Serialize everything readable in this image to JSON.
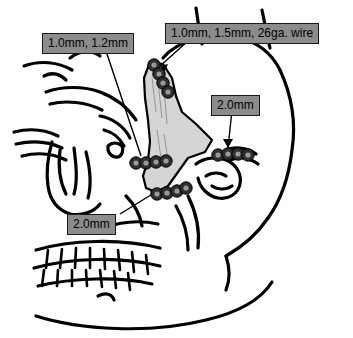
{
  "figure": {
    "kind": "anatomical-diagram",
    "background_color": "#ffffff",
    "line_color": "#000000",
    "shaded_bone_color": "#d5d5d5",
    "label_background_color": "#8c8c8c",
    "label_border_color": "#1a1a1a",
    "label_text_color": "#000000",
    "hardware_color": "#2b2b2b"
  },
  "callouts": [
    {
      "id": "frontozygomatic-lower",
      "text": "1.0mm, 1.2mm",
      "leader": "line from label down-right to infraorbital rim plate"
    },
    {
      "id": "frontozygomatic-upper",
      "text": "1.0mm, 1.5mm, 26ga. wire",
      "leader": "arrow from label down-left to frontozygomatic suture plate"
    },
    {
      "id": "zygomatic-arch",
      "text": "2.0mm",
      "leader": "arrow from label straight down to zygomatic arch plate"
    },
    {
      "id": "zygomaticomaxillary-buttress",
      "text": "2.0mm",
      "leader": "arrow from label up-right to buttress plate"
    }
  ],
  "hardware_sites": [
    {
      "id": "frontozygomatic-suture",
      "label_ref": "1.0mm, 1.5mm, 26ga. wire",
      "orientation": "vertical chain",
      "screw_count": 4
    },
    {
      "id": "infraorbital-rim",
      "label_ref": "1.0mm, 1.2mm",
      "orientation": "horizontal row",
      "screw_count": 5
    },
    {
      "id": "zygomatic-arch",
      "label_ref": "2.0mm",
      "orientation": "horizontal row",
      "screw_count": 4
    },
    {
      "id": "zygomaticomaxillary-buttress",
      "label_ref": "2.0mm",
      "orientation": "diagonal row",
      "screw_count": 5
    }
  ]
}
